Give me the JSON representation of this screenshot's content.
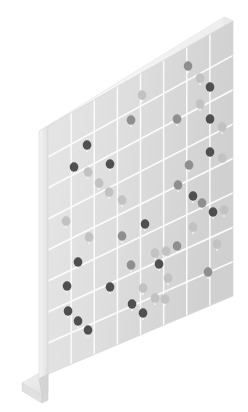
{
  "illustration": {
    "title": "Isometric Grid Board With Data Markers",
    "subject": "data-board",
    "view": "isometric",
    "canvas": {
      "width": 248,
      "height": 412
    },
    "background_color": "#ffffff"
  },
  "palette": {
    "face_light": "#e3e3e3",
    "face_dark": "#d2d2d2",
    "edge_top": "#f2f2f2",
    "edge_side": "#e9e9e9",
    "edge_side_shadow": "#dcdcdc",
    "base_top": "#ececec",
    "base_front": "#dddddd",
    "gridline": "#fbfbfb",
    "dot_dark": "#4f4f4f",
    "dot_mid": "#8f8f8f",
    "dot_light": "#c2c2c2",
    "outline": "#d8d8d8"
  },
  "board": {
    "label": "grid-panel",
    "thickness_px": 9,
    "face_corners": {
      "top_left": [
        48,
        126
      ],
      "top_right": [
        233,
        21
      ],
      "bottom_right": [
        233,
        296
      ],
      "bottom_left": [
        48,
        374
      ]
    },
    "columns": 8,
    "rows": 8,
    "grid_visible": true
  },
  "base": {
    "label": "floor-plinth",
    "corners": [
      [
        48,
        374
      ],
      [
        22,
        390
      ],
      [
        40,
        400
      ],
      [
        48,
        396
      ]
    ],
    "depth_px": 16
  },
  "markers": {
    "count": 48,
    "shape": "circle",
    "radius_px": 4.3,
    "has_stem": true,
    "legend": [
      {
        "name": "dark-marker",
        "color": "#4f4f4f",
        "count": 20
      },
      {
        "name": "mid-marker",
        "color": "#8f8f8f",
        "count": 11
      },
      {
        "name": "light-marker",
        "color": "#c2c2c2",
        "count": 17
      }
    ],
    "points": [
      {
        "x": 188,
        "y": 66,
        "tone": "mid"
      },
      {
        "x": 200,
        "y": 78,
        "tone": "light"
      },
      {
        "x": 210,
        "y": 87,
        "tone": "dark"
      },
      {
        "x": 142,
        "y": 95,
        "tone": "light"
      },
      {
        "x": 131,
        "y": 120,
        "tone": "mid"
      },
      {
        "x": 177,
        "y": 119,
        "tone": "mid"
      },
      {
        "x": 210,
        "y": 119,
        "tone": "dark"
      },
      {
        "x": 222,
        "y": 127,
        "tone": "light"
      },
      {
        "x": 87,
        "y": 145,
        "tone": "dark"
      },
      {
        "x": 74,
        "y": 167,
        "tone": "dark"
      },
      {
        "x": 110,
        "y": 164,
        "tone": "dark"
      },
      {
        "x": 88,
        "y": 172,
        "tone": "light"
      },
      {
        "x": 99,
        "y": 183,
        "tone": "light"
      },
      {
        "x": 109,
        "y": 192,
        "tone": "light"
      },
      {
        "x": 210,
        "y": 152,
        "tone": "dark"
      },
      {
        "x": 222,
        "y": 158,
        "tone": "light"
      },
      {
        "x": 189,
        "y": 165,
        "tone": "mid"
      },
      {
        "x": 66,
        "y": 221,
        "tone": "light"
      },
      {
        "x": 89,
        "y": 237,
        "tone": "light"
      },
      {
        "x": 122,
        "y": 236,
        "tone": "mid"
      },
      {
        "x": 145,
        "y": 224,
        "tone": "dark"
      },
      {
        "x": 178,
        "y": 185,
        "tone": "mid"
      },
      {
        "x": 193,
        "y": 196,
        "tone": "dark"
      },
      {
        "x": 202,
        "y": 203,
        "tone": "mid"
      },
      {
        "x": 213,
        "y": 212,
        "tone": "dark"
      },
      {
        "x": 155,
        "y": 253,
        "tone": "light"
      },
      {
        "x": 159,
        "y": 264,
        "tone": "dark"
      },
      {
        "x": 78,
        "y": 262,
        "tone": "dark"
      },
      {
        "x": 67,
        "y": 286,
        "tone": "dark"
      },
      {
        "x": 110,
        "y": 287,
        "tone": "dark"
      },
      {
        "x": 143,
        "y": 288,
        "tone": "light"
      },
      {
        "x": 155,
        "y": 298,
        "tone": "light"
      },
      {
        "x": 165,
        "y": 299,
        "tone": "light"
      },
      {
        "x": 132,
        "y": 304,
        "tone": "dark"
      },
      {
        "x": 143,
        "y": 313,
        "tone": "dark"
      },
      {
        "x": 68,
        "y": 311,
        "tone": "dark"
      },
      {
        "x": 78,
        "y": 321,
        "tone": "dark"
      },
      {
        "x": 88,
        "y": 330,
        "tone": "dark"
      },
      {
        "x": 193,
        "y": 227,
        "tone": "light"
      },
      {
        "x": 224,
        "y": 210,
        "tone": "light"
      },
      {
        "x": 217,
        "y": 244,
        "tone": "light"
      },
      {
        "x": 208,
        "y": 272,
        "tone": "mid"
      },
      {
        "x": 168,
        "y": 278,
        "tone": "light"
      },
      {
        "x": 122,
        "y": 200,
        "tone": "light"
      },
      {
        "x": 177,
        "y": 246,
        "tone": "mid"
      },
      {
        "x": 200,
        "y": 104,
        "tone": "light"
      },
      {
        "x": 166,
        "y": 251,
        "tone": "light"
      },
      {
        "x": 131,
        "y": 265,
        "tone": "mid"
      }
    ]
  }
}
